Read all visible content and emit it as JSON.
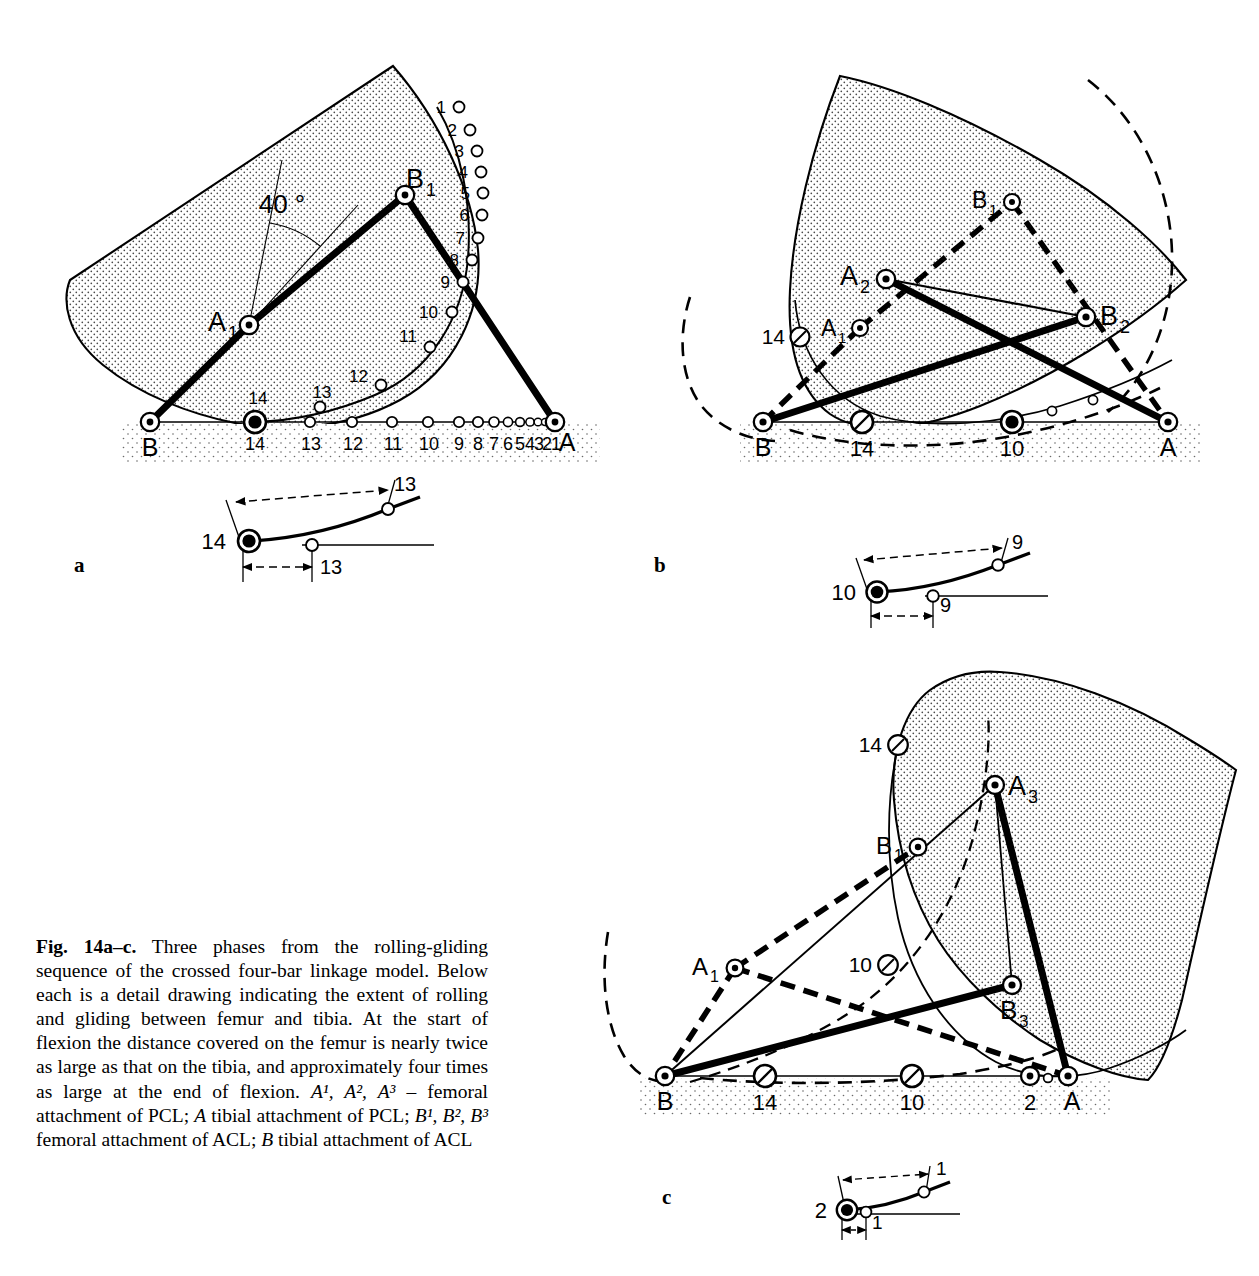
{
  "figure": {
    "number": "Fig. 14a–c.",
    "caption_runs": [
      {
        "t": "Fig. 14a–c.",
        "style": "bold"
      },
      {
        "t": " Three phases from the rolling-gliding sequence of the crossed four-bar linkage model. Below each is a detail drawing indicating the extent of rolling and gliding between femur and tibia. At the start of flexion the distance covered on the femur is nearly twice as large as that on the tibia, and approximately four times as large at the end of flexion. ",
        "style": "normal"
      },
      {
        "t": "A¹, A², A³",
        "style": "italic"
      },
      {
        "t": " – femoral attachment of PCL; ",
        "style": "normal"
      },
      {
        "t": "A",
        "style": "italic"
      },
      {
        "t": " tibial attachment of PCL; ",
        "style": "normal"
      },
      {
        "t": "B¹, B², B³",
        "style": "italic"
      },
      {
        "t": " femoral attachment of ACL; ",
        "style": "normal"
      },
      {
        "t": "B",
        "style": "italic"
      },
      {
        "t": " tibial attachment of ACL",
        "style": "normal"
      }
    ],
    "caption_plain": "Fig. 14a–c. Three phases from the rolling-gliding sequence of the crossed four-bar linkage model. Below each is a detail drawing indicating the extent of rolling and gliding between femur and tibia. At the start of flexion the distance covered on the femur is nearly twice as large as that on the tibia, and approximately four times as large at the end of flexion. A¹, A², A³ – femoral attachment of PCL; A tibial attachment of PCL; B¹, B², B³ femoral attachment of ACL; B tibial attachment of ACL"
  },
  "panels": [
    {
      "id": "a",
      "label": "a",
      "angle_annotation": "40 °",
      "point_labels": {
        "A1": "A",
        "A1_sub": "1",
        "B1": "B",
        "B1_sub": "1",
        "A": "A",
        "B": "B"
      },
      "tibia_tick_labels": [
        "14",
        "13",
        "12",
        "11",
        "10",
        "9",
        "8",
        "7",
        "6",
        "5",
        "4",
        "3",
        "2",
        "1"
      ],
      "femur_tick_labels": [
        "1",
        "2",
        "3",
        "4",
        "5",
        "6",
        "7",
        "8",
        "9",
        "10",
        "11",
        "12",
        "13",
        "14"
      ],
      "detail": {
        "contact_label": "14",
        "femur_travel_label": "13",
        "tibia_travel_label": "13"
      }
    },
    {
      "id": "b",
      "label": "b",
      "point_labels": {
        "A1": "A",
        "A1_sub": "1",
        "A2": "A",
        "A2_sub": "2",
        "B1": "B",
        "B1_sub": "1",
        "B2": "B",
        "B2_sub": "2",
        "A": "A",
        "B": "B"
      },
      "marker_labels": [
        "14",
        "14",
        "10"
      ],
      "detail": {
        "contact_label": "10",
        "femur_travel_label": "9",
        "tibia_travel_label": "9"
      }
    },
    {
      "id": "c",
      "label": "c",
      "point_labels": {
        "A1": "A",
        "A1_sub": "1",
        "A3": "A",
        "A3_sub": "3",
        "B1": "B",
        "B1_sub": "1",
        "B3": "B",
        "B3_sub": "3",
        "A": "A",
        "B": "B"
      },
      "marker_labels": [
        "14",
        "10",
        "14",
        "10",
        "2"
      ],
      "detail": {
        "contact_label": "2",
        "femur_travel_label": "1",
        "tibia_travel_label": "1"
      }
    }
  ],
  "colors": {
    "ink": "#000000",
    "stipple": "#d9d9d9",
    "paper": "#ffffff"
  }
}
